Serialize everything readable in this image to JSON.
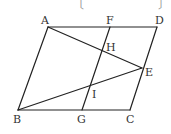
{
  "figure": {
    "type": "parallelogram-geometry",
    "brackets": {
      "left": "〔",
      "right": "〕"
    },
    "points": {
      "A": {
        "label": "A",
        "x": 48,
        "y": 27
      },
      "F": {
        "label": "F",
        "x": 110,
        "y": 27
      },
      "D": {
        "label": "D",
        "x": 157,
        "y": 27
      },
      "H": {
        "label": "H",
        "x": 102,
        "y": 50
      },
      "E": {
        "label": "E",
        "x": 142,
        "y": 68
      },
      "I": {
        "label": "I",
        "x": 90,
        "y": 87
      },
      "B": {
        "label": "B",
        "x": 18,
        "y": 110
      },
      "G": {
        "label": "G",
        "x": 82,
        "y": 110
      },
      "C": {
        "label": "C",
        "x": 130,
        "y": 110
      }
    },
    "segments": [
      [
        "A",
        "D"
      ],
      [
        "D",
        "C"
      ],
      [
        "C",
        "B"
      ],
      [
        "B",
        "A"
      ],
      [
        "F",
        "G"
      ],
      [
        "A",
        "E"
      ],
      [
        "B",
        "E"
      ]
    ]
  }
}
